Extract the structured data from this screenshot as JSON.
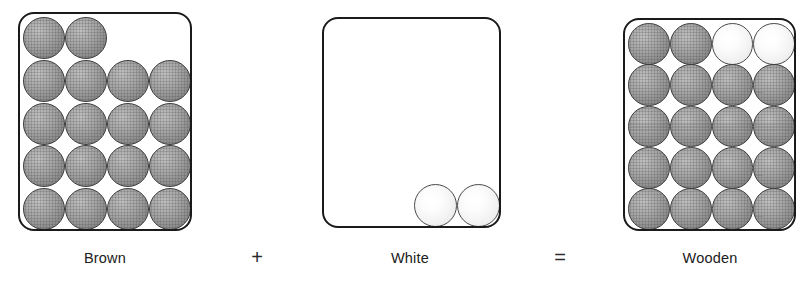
{
  "figure": {
    "type": "sphere-packing-equation",
    "panels": [
      {
        "id": "brown",
        "label": "Brown",
        "box": {
          "x": 18,
          "y": 12,
          "w": 174,
          "h": 219
        },
        "sphere_count": 18,
        "sphere_color_name": "gray",
        "sphere_hex": "#a6a6a6",
        "rows": [
          {
            "count": 2,
            "colors": [
              "gray",
              "gray"
            ]
          },
          {
            "count": 4,
            "colors": [
              "gray",
              "gray",
              "gray",
              "gray"
            ]
          },
          {
            "count": 4,
            "colors": [
              "gray",
              "gray",
              "gray",
              "gray"
            ]
          },
          {
            "count": 4,
            "colors": [
              "gray",
              "gray",
              "gray",
              "gray"
            ]
          },
          {
            "count": 4,
            "colors": [
              "gray",
              "gray",
              "gray",
              "gray"
            ]
          }
        ]
      },
      {
        "id": "white",
        "label": "White",
        "box": {
          "x": 322,
          "y": 17,
          "w": 179,
          "h": 211
        },
        "sphere_count": 2,
        "sphere_color_name": "white",
        "sphere_hex": "#f2f2f2",
        "rows": [
          {
            "count": 0,
            "colors": []
          },
          {
            "count": 0,
            "colors": []
          },
          {
            "count": 0,
            "colors": []
          },
          {
            "count": 0,
            "colors": []
          },
          {
            "count": 2,
            "colors": [
              "white",
              "white"
            ],
            "align": "right"
          }
        ]
      },
      {
        "id": "wooden",
        "label": "Wooden",
        "box": {
          "x": 623,
          "y": 18,
          "w": 173,
          "h": 213
        },
        "sphere_count": 20,
        "sphere_color_name": "mixed",
        "sphere_hex": "#a6a6a6",
        "rows": [
          {
            "count": 4,
            "colors": [
              "gray",
              "gray",
              "white",
              "white"
            ]
          },
          {
            "count": 4,
            "colors": [
              "gray",
              "gray",
              "gray",
              "gray"
            ]
          },
          {
            "count": 4,
            "colors": [
              "gray",
              "gray",
              "gray",
              "gray"
            ]
          },
          {
            "count": 4,
            "colors": [
              "gray",
              "gray",
              "gray",
              "gray"
            ]
          },
          {
            "count": 4,
            "colors": [
              "gray",
              "gray",
              "gray",
              "gray"
            ]
          }
        ]
      }
    ],
    "operators": {
      "plus": "+",
      "equals": "="
    },
    "colors": {
      "border": "#1a1a1a",
      "sphere_gray": "#a6a6a6",
      "sphere_gray_outline": "#3b3b3b",
      "sphere_white": "#f6f6f6",
      "sphere_white_outline": "#4a4a4a",
      "text": "#202020",
      "background": "#ffffff"
    }
  }
}
